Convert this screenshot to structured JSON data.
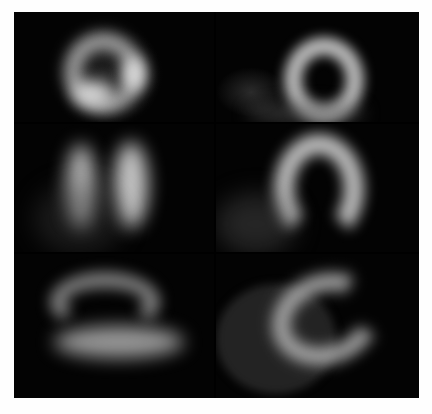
{
  "figure": {
    "layout": {
      "rows": 3,
      "columns": 2
    },
    "panels": [
      {
        "row": 1,
        "col": 1,
        "view": "short-axis ring"
      },
      {
        "row": 1,
        "col": 2,
        "view": "short-axis ring"
      },
      {
        "row": 2,
        "col": 1,
        "view": "vertical long-axis horseshoe"
      },
      {
        "row": 2,
        "col": 2,
        "view": "vertical long-axis horseshoe"
      },
      {
        "row": 3,
        "col": 1,
        "view": "horizontal long-axis horseshoe"
      },
      {
        "row": 3,
        "col": 2,
        "view": "horizontal long-axis horseshoe"
      }
    ],
    "colors": {
      "background": "#000000",
      "page": "#fefefe",
      "signal": "#e8e8e8"
    }
  }
}
